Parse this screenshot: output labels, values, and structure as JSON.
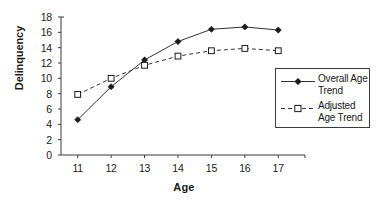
{
  "chart_data": {
    "type": "line",
    "title": "",
    "xlabel": "Age",
    "ylabel": "Delinquency",
    "x": [
      11,
      12,
      13,
      14,
      15,
      16,
      17
    ],
    "xtick_labels": [
      "11",
      "12",
      "13",
      "14",
      "15",
      "16",
      "17"
    ],
    "ytick_labels": [
      "0",
      "2",
      "4",
      "6",
      "8",
      "10",
      "12",
      "14",
      "16",
      "18"
    ],
    "ytick_values": [
      0,
      2,
      4,
      6,
      8,
      10,
      12,
      14,
      16,
      18
    ],
    "xlim": [
      10.5,
      17.8
    ],
    "ylim": [
      0,
      18
    ],
    "grid": false,
    "legend_position": "right",
    "series": [
      {
        "name": "Overall Age Trend",
        "values": [
          4.6,
          8.9,
          12.4,
          14.8,
          16.4,
          16.7,
          16.3
        ],
        "line_style": "solid",
        "marker": "filled-diamond",
        "color": "#333333"
      },
      {
        "name": "Adjusted Age Trend",
        "values": [
          7.9,
          10.0,
          11.7,
          12.9,
          13.6,
          13.9,
          13.6
        ],
        "line_style": "dashed",
        "marker": "open-square",
        "color": "#333333"
      }
    ]
  },
  "legend": {
    "entries": [
      {
        "label_line1": "Overall Age",
        "label_line2": "Trend"
      },
      {
        "label_line1": "Adjusted",
        "label_line2": "Age Trend"
      }
    ]
  },
  "colors": {
    "axis": "#3b3b3b",
    "series": "#333333",
    "background": "#ffffff"
  }
}
